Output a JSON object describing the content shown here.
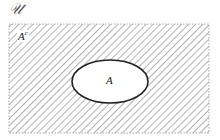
{
  "diagram": {
    "type": "venn",
    "universe": {
      "label": "𝒰",
      "rect": {
        "x": 9,
        "y": 24,
        "width": 200,
        "height": 109
      },
      "fill": "hatched",
      "hatch_color": "#8a8a8a",
      "border_color": "#aaaaaa"
    },
    "complement": {
      "base": "A",
      "superscript": "c"
    },
    "set": {
      "label": "A",
      "ellipse": {
        "cx": 110,
        "cy": 81.5,
        "rx": 38,
        "ry": 21.5
      },
      "fill": "#ffffff",
      "stroke": "#222222"
    },
    "shaded_region": "A complement (everything outside A within 𝒰)"
  }
}
